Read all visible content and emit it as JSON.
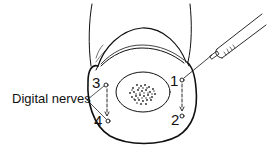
{
  "figure": {
    "label_digital_nerves": "Digital nerves",
    "points": [
      {
        "id": "1",
        "label": "1"
      },
      {
        "id": "2",
        "label": "2"
      },
      {
        "id": "3",
        "label": "3"
      },
      {
        "id": "4",
        "label": "4"
      }
    ],
    "colors": {
      "ink": "#111111",
      "background": "#ffffff"
    },
    "icons": {
      "syringe": "syringe-icon",
      "bone": "bone-cross-section",
      "nail": "nail-outline"
    }
  }
}
